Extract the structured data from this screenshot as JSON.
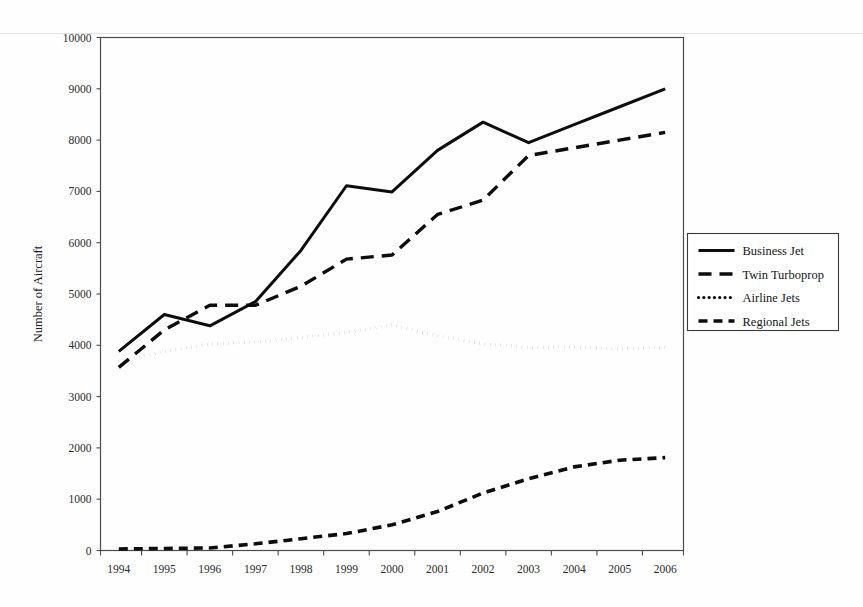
{
  "chart_data": {
    "type": "line",
    "title": "",
    "xlabel": "",
    "ylabel": "Number of Aircraft",
    "categories": [
      "1994",
      "1995",
      "1996",
      "1997",
      "1998",
      "1999",
      "2000",
      "2001",
      "2002",
      "2003",
      "2004",
      "2005",
      "2006"
    ],
    "ylim": [
      0,
      10000
    ],
    "yticks": [
      0,
      1000,
      2000,
      3000,
      4000,
      5000,
      6000,
      7000,
      8000,
      9000,
      10000
    ],
    "ytick_labels": [
      "0",
      "1000",
      "2000",
      "3000",
      "4000",
      "5000",
      "6000",
      "7000",
      "8000",
      "9000",
      "10000"
    ],
    "grid": false,
    "legend_position": "right",
    "series": [
      {
        "name": "Business Jet",
        "style": "solid",
        "values": [
          3880,
          4600,
          4380,
          4850,
          5850,
          7110,
          6990,
          7800,
          8350,
          7950,
          8300,
          8650,
          9000
        ]
      },
      {
        "name": "Twin Turboprop",
        "style": "long-dash",
        "values": [
          3570,
          4300,
          4780,
          4780,
          5150,
          5680,
          5760,
          6550,
          6830,
          7700,
          7850,
          8000,
          8150
        ]
      },
      {
        "name": "Airline Jets",
        "style": "dotted",
        "values": [
          3680,
          3880,
          4020,
          4070,
          4150,
          4250,
          4400,
          4180,
          4030,
          3960,
          3970,
          3930,
          3960
        ]
      },
      {
        "name": "Regional Jets",
        "style": "dash",
        "values": [
          30,
          40,
          50,
          130,
          230,
          330,
          500,
          760,
          1120,
          1400,
          1630,
          1760,
          1810
        ]
      }
    ]
  },
  "axes": {
    "y_axis_title": "Number of Aircraft"
  },
  "legend": {
    "entries": [
      {
        "label": "Business Jet",
        "swatch": "solid-line-swatch"
      },
      {
        "label": "Twin Turboprop",
        "swatch": "long-dash-line-swatch"
      },
      {
        "label": "Airline Jets",
        "swatch": "dotted-line-swatch"
      },
      {
        "label": "Regional Jets",
        "swatch": "dash-line-swatch"
      }
    ]
  },
  "colors": {
    "series_ink": "#0d0d0d",
    "frame": "#4b4b50",
    "page_background": "#ffffff"
  }
}
